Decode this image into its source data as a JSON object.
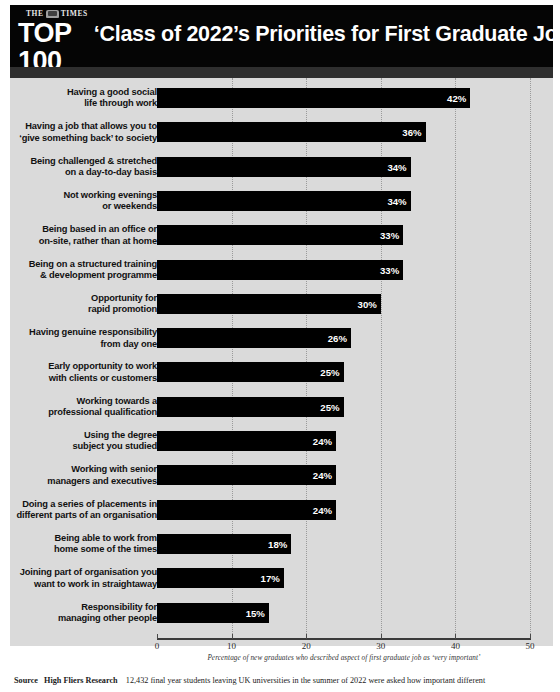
{
  "header": {
    "masthead_top": "THE TIMES",
    "crest_icon": "times-crest-icon",
    "masthead_main": "TOP 100",
    "masthead_sub": "GRADUATE EMPLOYERS",
    "title": "‘Class of 2022’s Priorities for First Graduate Job"
  },
  "footer": {
    "source_label": "Source",
    "source_org": "High Fliers Research",
    "source_text": "12,432 final year students leaving UK universities in the summer of 2022 were asked how important different"
  },
  "chart_data": {
    "type": "bar",
    "orientation": "horizontal",
    "title": "‘Class of 2022’s Priorities for First Graduate Job",
    "xlabel": "Percentage of new graduates who described aspect of first graduate job as ‘very important’",
    "ylabel": "",
    "xlim": [
      0,
      50
    ],
    "xticks": [
      0,
      10,
      20,
      30,
      40,
      50
    ],
    "grid": true,
    "grid_axis": "x",
    "legend": false,
    "bar_color": "#000000",
    "value_suffix": "%",
    "categories": [
      "Having a good social\nlife through work",
      "Having a job that allows you to\n‘give something back’ to society",
      "Being challenged & stretched\non a day-to-day basis",
      "Not working evenings\nor weekends",
      "Being based in an office or\non-site, rather than at home",
      "Being on a structured training\n& development programme",
      "Opportunity for\nrapid promotion",
      "Having genuine responsibility\nfrom day one",
      "Early opportunity to work\nwith clients or customers",
      "Working towards a\nprofessional qualification",
      "Using the degree\nsubject you studied",
      "Working with senior\nmanagers and executives",
      "Doing a series of placements in\ndifferent parts of an organisation",
      "Being able to work from\nhome some of the times",
      "Joining part of organisation you\nwant to work in straightaway",
      "Responsibility for\nmanaging other people"
    ],
    "values": [
      42,
      36,
      34,
      34,
      33,
      33,
      30,
      26,
      25,
      25,
      24,
      24,
      24,
      18,
      17,
      15
    ],
    "value_labels": [
      "42%",
      "36%",
      "34%",
      "34%",
      "33%",
      "33%",
      "30%",
      "26%",
      "25%",
      "25%",
      "24%",
      "24%",
      "24%",
      "18%",
      "17%",
      "15%"
    ]
  }
}
